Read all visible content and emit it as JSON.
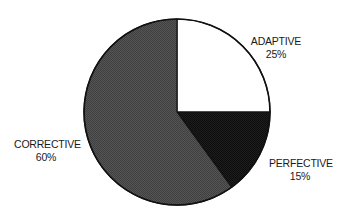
{
  "chart_data": {
    "type": "pie",
    "title": "",
    "start_angle_deg": 0,
    "direction": "clockwise",
    "slices": [
      {
        "label": "ADAPTIVE",
        "value": 25,
        "value_label": "25%",
        "color": "#ffffff"
      },
      {
        "label": "PERFECTIVE",
        "value": 15,
        "value_label": "15%",
        "color": "#1a1a1a"
      },
      {
        "label": "CORRECTIVE",
        "value": 60,
        "value_label": "60%",
        "color": "#4d4d4d"
      }
    ],
    "legend": "none",
    "labels_outside": true
  },
  "labels": {
    "adaptive": {
      "name": "ADAPTIVE",
      "pct": "25%"
    },
    "perfective": {
      "name": "PERFECTIVE",
      "pct": "15%"
    },
    "corrective": {
      "name": "CORRECTIVE",
      "pct": "60%"
    }
  }
}
